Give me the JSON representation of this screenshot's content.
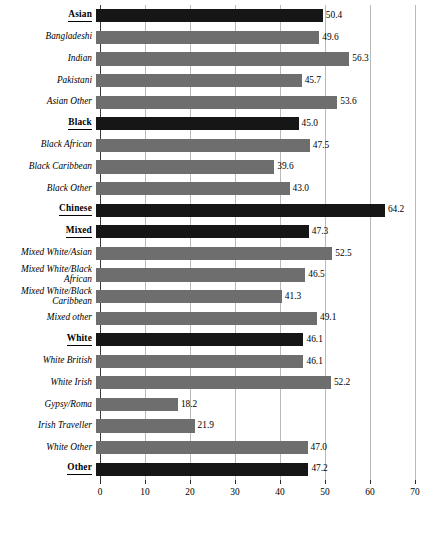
{
  "chart_data": {
    "type": "bar",
    "orientation": "horizontal",
    "title": "",
    "subtitle": "",
    "xlabel": "",
    "ylabel": "",
    "xlim": [
      0,
      70
    ],
    "xticks": [
      0,
      10,
      20,
      30,
      40,
      50,
      60,
      70
    ],
    "xtick_labels": [
      "0",
      "10",
      "20",
      "30",
      "40",
      "50",
      "60",
      "70"
    ],
    "grid": true,
    "legend": null,
    "colors": {
      "group_header_bar": "#161616",
      "subgroup_bar": "#6e6e6e",
      "gridline": "#b9b9b9",
      "axis": "#3a3a3a",
      "text": "#000000",
      "background": "#ffffff"
    },
    "categories": [
      "Asian",
      "Bangladeshi",
      "Indian",
      "Pakistani",
      "Asian Other",
      "Black",
      "Black African",
      "Black Caribbean",
      "Black Other",
      "Chinese",
      "Mixed",
      "Mixed White/Asian",
      "Mixed White/Black African",
      "Mixed White/Black Caribbean",
      "Mixed other",
      "White",
      "White British",
      "White Irish",
      "Gypsy/Roma",
      "Irish Traveller",
      "White Other",
      "Other"
    ],
    "values": [
      50.4,
      49.6,
      56.3,
      45.7,
      53.6,
      45.0,
      47.5,
      39.6,
      43.0,
      64.2,
      47.3,
      52.5,
      46.5,
      41.3,
      49.1,
      46.1,
      46.1,
      52.2,
      18.2,
      21.9,
      47.0,
      47.2
    ],
    "rows": [
      {
        "label": "Asian",
        "label_lines": [
          "Asian"
        ],
        "value": 50.4,
        "value_text": "50.4",
        "header": true
      },
      {
        "label": "Bangladeshi",
        "label_lines": [
          "Bangladeshi"
        ],
        "value": 49.6,
        "value_text": "49.6",
        "header": false
      },
      {
        "label": "Indian",
        "label_lines": [
          "Indian"
        ],
        "value": 56.3,
        "value_text": "56.3",
        "header": false
      },
      {
        "label": "Pakistani",
        "label_lines": [
          "Pakistani"
        ],
        "value": 45.7,
        "value_text": "45.7",
        "header": false
      },
      {
        "label": "Asian Other",
        "label_lines": [
          "Asian Other"
        ],
        "value": 53.6,
        "value_text": "53.6",
        "header": false
      },
      {
        "label": "Black",
        "label_lines": [
          "Black"
        ],
        "value": 45.0,
        "value_text": "45.0",
        "header": true
      },
      {
        "label": "Black African",
        "label_lines": [
          "Black African"
        ],
        "value": 47.5,
        "value_text": "47.5",
        "header": false
      },
      {
        "label": "Black Caribbean",
        "label_lines": [
          "Black Caribbean"
        ],
        "value": 39.6,
        "value_text": "39.6",
        "header": false
      },
      {
        "label": "Black Other",
        "label_lines": [
          "Black Other"
        ],
        "value": 43.0,
        "value_text": "43.0",
        "header": false
      },
      {
        "label": "Chinese",
        "label_lines": [
          "Chinese"
        ],
        "value": 64.2,
        "value_text": "64.2",
        "header": true
      },
      {
        "label": "Mixed",
        "label_lines": [
          "Mixed"
        ],
        "value": 47.3,
        "value_text": "47.3",
        "header": true
      },
      {
        "label": "Mixed White/Asian",
        "label_lines": [
          "Mixed White/Asian"
        ],
        "value": 52.5,
        "value_text": "52.5",
        "header": false
      },
      {
        "label": "Mixed White/Black African",
        "label_lines": [
          "Mixed White/Black",
          "African"
        ],
        "value": 46.5,
        "value_text": "46.5",
        "header": false
      },
      {
        "label": "Mixed White/Black Caribbean",
        "label_lines": [
          "Mixed White/Black",
          "Caribbean"
        ],
        "value": 41.3,
        "value_text": "41.3",
        "header": false
      },
      {
        "label": "Mixed other",
        "label_lines": [
          "Mixed other"
        ],
        "value": 49.1,
        "value_text": "49.1",
        "header": false
      },
      {
        "label": "White",
        "label_lines": [
          "White"
        ],
        "value": 46.1,
        "value_text": "46.1",
        "header": true
      },
      {
        "label": "White British",
        "label_lines": [
          "White British"
        ],
        "value": 46.1,
        "value_text": "46.1",
        "header": false
      },
      {
        "label": "White Irish",
        "label_lines": [
          "White Irish"
        ],
        "value": 52.2,
        "value_text": "52.2",
        "header": false
      },
      {
        "label": "Gypsy/Roma",
        "label_lines": [
          "Gypsy/Roma"
        ],
        "value": 18.2,
        "value_text": "18.2",
        "header": false
      },
      {
        "label": "Irish Traveller",
        "label_lines": [
          "Irish Traveller"
        ],
        "value": 21.9,
        "value_text": "21.9",
        "header": false
      },
      {
        "label": "White Other",
        "label_lines": [
          "White Other"
        ],
        "value": 47.0,
        "value_text": "47.0",
        "header": false
      },
      {
        "label": "Other",
        "label_lines": [
          "Other"
        ],
        "value": 47.2,
        "value_text": "47.2",
        "header": true
      }
    ]
  }
}
